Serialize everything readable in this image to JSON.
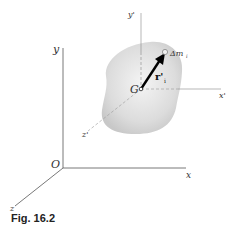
{
  "figure": {
    "caption": "Fig. 16.2",
    "labels": {
      "y": "y",
      "x": "x",
      "z": "z",
      "origin": "O",
      "y_prime": "y'",
      "x_prime": "x'",
      "z_prime": "z'",
      "center": "G",
      "vector": "r'",
      "vector_sub": "i",
      "mass": "Δm",
      "mass_sub": "i"
    },
    "colors": {
      "axis": "#555555",
      "blob": "#d9d9d9",
      "arrow": "#000000"
    }
  }
}
